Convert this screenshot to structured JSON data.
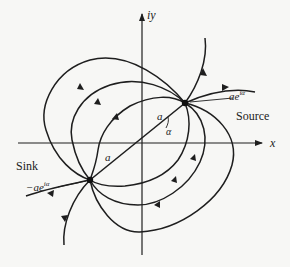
{
  "diagram": {
    "type": "flow-field",
    "axes": {
      "x_label": "x",
      "y_label": "iy"
    },
    "points": {
      "source": {
        "label": "Source",
        "value_prefix": "",
        "value_base": "ae",
        "value_exp": "iα"
      },
      "sink": {
        "label": "Sink",
        "value_prefix": "−",
        "value_base": "ae",
        "value_exp": "iα"
      }
    },
    "segment_labels": {
      "upper_a": "a",
      "lower_a": "a",
      "angle": "α"
    },
    "colors": {
      "stroke": "#1e1e1e",
      "background": "#f7f7f5"
    }
  }
}
